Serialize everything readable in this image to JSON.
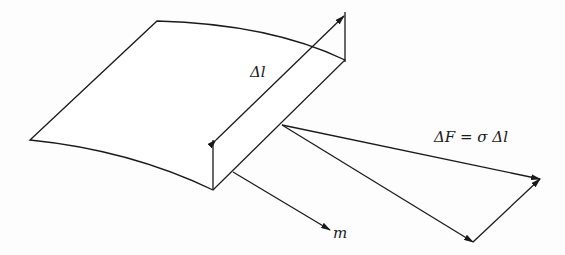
{
  "diagram": {
    "labels": {
      "delta_l": "Δl",
      "force_equation": "ΔF = σ Δl",
      "normal_vector": "m"
    },
    "colors": {
      "stroke": "#1a1a1a",
      "background": "#fdfdfd"
    }
  }
}
